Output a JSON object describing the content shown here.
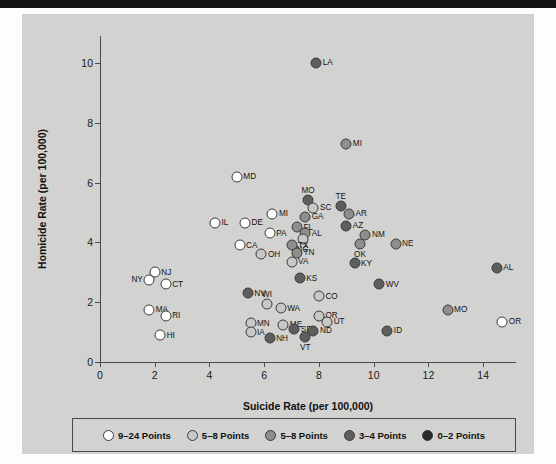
{
  "chart_data": {
    "type": "scatter",
    "title": "",
    "xlabel": "Suicide Rate (per 100,000)",
    "ylabel": "Homicide Rate (per 100,000)",
    "xlim": [
      0,
      15.2
    ],
    "ylim": [
      0,
      10.9
    ],
    "xticks": [
      0,
      2,
      4,
      6,
      8,
      10,
      12,
      14
    ],
    "yticks": [
      0,
      2,
      4,
      6,
      8,
      10
    ],
    "grid": false,
    "legend_position": "bottom",
    "legend": [
      {
        "label": "9–24 Points",
        "color": "#ffffff"
      },
      {
        "label": "5–8 Points",
        "color": "#c8c8c6"
      },
      {
        "label": "5–8 Points",
        "color": "#8e8e8c"
      },
      {
        "label": "3–4 Points",
        "color": "#5e5e5c"
      },
      {
        "label": "0–2 Points",
        "color": "#2b2b2b"
      }
    ],
    "points": [
      {
        "label": "LA",
        "x": 7.9,
        "y": 10.0,
        "group": 3,
        "lpos": "right"
      },
      {
        "label": "MI",
        "x": 9.0,
        "y": 7.3,
        "group": 2,
        "lpos": "right"
      },
      {
        "label": "MD",
        "x": 5.0,
        "y": 6.2,
        "group": 0,
        "lpos": "right"
      },
      {
        "label": "MO",
        "x": 7.6,
        "y": 5.4,
        "group": 3,
        "lpos": "above"
      },
      {
        "label": "SC",
        "x": 7.8,
        "y": 5.15,
        "group": 1,
        "lpos": "right"
      },
      {
        "label": "TE",
        "x": 8.8,
        "y": 5.2,
        "group": 3,
        "lpos": "above"
      },
      {
        "label": "AR",
        "x": 9.1,
        "y": 4.95,
        "group": 2,
        "lpos": "right"
      },
      {
        "label": "GA",
        "x": 7.5,
        "y": 4.85,
        "group": 2,
        "lpos": "right"
      },
      {
        "label": "MI",
        "x": 6.3,
        "y": 4.95,
        "group": 0,
        "lpos": "right"
      },
      {
        "label": "AZ",
        "x": 9.0,
        "y": 4.55,
        "group": 3,
        "lpos": "right"
      },
      {
        "label": "IL",
        "x": 4.2,
        "y": 4.65,
        "group": 0,
        "lpos": "right"
      },
      {
        "label": "DE",
        "x": 5.3,
        "y": 4.65,
        "group": 0,
        "lpos": "right"
      },
      {
        "label": "FL",
        "x": 7.2,
        "y": 4.5,
        "group": 2,
        "lpos": "right"
      },
      {
        "label": "AL",
        "x": 7.5,
        "y": 4.3,
        "group": 2,
        "lpos": "right"
      },
      {
        "label": "NC",
        "x": 7.4,
        "y": 4.1,
        "group": 1,
        "lpos": "below"
      },
      {
        "label": "PA",
        "x": 6.2,
        "y": 4.3,
        "group": 0,
        "lpos": "right"
      },
      {
        "label": "NM",
        "x": 9.7,
        "y": 4.25,
        "group": 2,
        "lpos": "right"
      },
      {
        "label": "CA",
        "x": 5.1,
        "y": 3.9,
        "group": 0,
        "lpos": "right"
      },
      {
        "label": "TX",
        "x": 7.0,
        "y": 3.9,
        "group": 2,
        "lpos": "right"
      },
      {
        "label": "OK",
        "x": 9.5,
        "y": 3.95,
        "group": 2,
        "lpos": "below"
      },
      {
        "label": "NE",
        "x": 10.8,
        "y": 3.95,
        "group": 2,
        "lpos": "right"
      },
      {
        "label": "OH",
        "x": 5.9,
        "y": 3.6,
        "group": 1,
        "lpos": "right"
      },
      {
        "label": "TN",
        "x": 7.2,
        "y": 3.65,
        "group": 2,
        "lpos": "right"
      },
      {
        "label": "VA",
        "x": 7.0,
        "y": 3.35,
        "group": 1,
        "lpos": "right"
      },
      {
        "label": "KY",
        "x": 9.3,
        "y": 3.3,
        "group": 3,
        "lpos": "right"
      },
      {
        "label": "AL",
        "x": 14.5,
        "y": 3.15,
        "group": 3,
        "lpos": "right"
      },
      {
        "label": "NJ",
        "x": 2.0,
        "y": 3.0,
        "group": 0,
        "lpos": "right"
      },
      {
        "label": "NY",
        "x": 1.8,
        "y": 2.75,
        "group": 0,
        "lpos": "left"
      },
      {
        "label": "CT",
        "x": 2.4,
        "y": 2.6,
        "group": 0,
        "lpos": "right"
      },
      {
        "label": "KS",
        "x": 7.3,
        "y": 2.8,
        "group": 3,
        "lpos": "right"
      },
      {
        "label": "WV",
        "x": 10.2,
        "y": 2.6,
        "group": 3,
        "lpos": "right"
      },
      {
        "label": "NV",
        "x": 5.4,
        "y": 2.3,
        "group": 3,
        "lpos": "right"
      },
      {
        "label": "CO",
        "x": 8.0,
        "y": 2.2,
        "group": 1,
        "lpos": "right"
      },
      {
        "label": "WI",
        "x": 6.1,
        "y": 1.95,
        "group": 1,
        "lpos": "above"
      },
      {
        "label": "WA",
        "x": 6.6,
        "y": 1.8,
        "group": 1,
        "lpos": "right"
      },
      {
        "label": "MA",
        "x": 1.8,
        "y": 1.75,
        "group": 0,
        "lpos": "right"
      },
      {
        "label": "RI",
        "x": 2.4,
        "y": 1.55,
        "group": 0,
        "lpos": "right"
      },
      {
        "label": "MO",
        "x": 12.7,
        "y": 1.75,
        "group": 2,
        "lpos": "right"
      },
      {
        "label": "OR",
        "x": 8.0,
        "y": 1.55,
        "group": 1,
        "lpos": "right"
      },
      {
        "label": "UT",
        "x": 8.3,
        "y": 1.35,
        "group": 1,
        "lpos": "right"
      },
      {
        "label": "OR",
        "x": 14.7,
        "y": 1.35,
        "group": 0,
        "lpos": "right"
      },
      {
        "label": "MN",
        "x": 5.5,
        "y": 1.3,
        "group": 1,
        "lpos": "right"
      },
      {
        "label": "ME",
        "x": 6.7,
        "y": 1.25,
        "group": 1,
        "lpos": "right"
      },
      {
        "label": "SD",
        "x": 7.1,
        "y": 1.1,
        "group": 3,
        "lpos": "right"
      },
      {
        "label": "ND",
        "x": 7.8,
        "y": 1.05,
        "group": 3,
        "lpos": "right"
      },
      {
        "label": "ID",
        "x": 10.5,
        "y": 1.05,
        "group": 3,
        "lpos": "right"
      },
      {
        "label": "IA",
        "x": 5.5,
        "y": 1.0,
        "group": 1,
        "lpos": "right"
      },
      {
        "label": "VT",
        "x": 7.5,
        "y": 0.85,
        "group": 3,
        "lpos": "below"
      },
      {
        "label": "NH",
        "x": 6.2,
        "y": 0.8,
        "group": 3,
        "lpos": "right"
      },
      {
        "label": "HI",
        "x": 2.2,
        "y": 0.9,
        "group": 0,
        "lpos": "right"
      }
    ]
  }
}
